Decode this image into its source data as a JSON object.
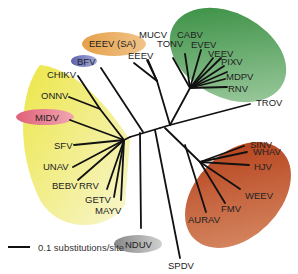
{
  "diagram": {
    "type": "unrooted phylogenetic tree",
    "scale_bar": {
      "label": "0.1 substitutions/site"
    },
    "clade_colors": {
      "green": "#3f9a4a",
      "yellow": "#f0ea60",
      "red": "#c0461f",
      "orange": "#e8a050",
      "blue": "#6a70b8",
      "pink": "#e06a7a",
      "gray": "#a0a0a0"
    },
    "labels": {
      "eeev_sa": "EEEV (SA)",
      "eeev": "EEEV",
      "mucv": "MUCV",
      "cabv": "CABV",
      "tonv": "TONV",
      "evev": "EVEV",
      "veev": "VEEV",
      "pixv": "PIXV",
      "mdpv": "MDPV",
      "rnv": "RNV",
      "bfv": "BFV",
      "chikv": "CHIKV",
      "onnv": "ONNV",
      "midv": "MIDV",
      "sfv": "SFV",
      "unav": "UNAV",
      "bebv": "BEBV",
      "rrv": "RRV",
      "getv": "GETV",
      "mayv": "MAYV",
      "nduv": "NDUV",
      "trov": "TROV",
      "sinv": "SINV",
      "whav": "WHAV",
      "hjv": "HJV",
      "weev": "WEEV",
      "fmv": "FMV",
      "aurav": "AURAV",
      "spdv": "SPDV"
    }
  }
}
